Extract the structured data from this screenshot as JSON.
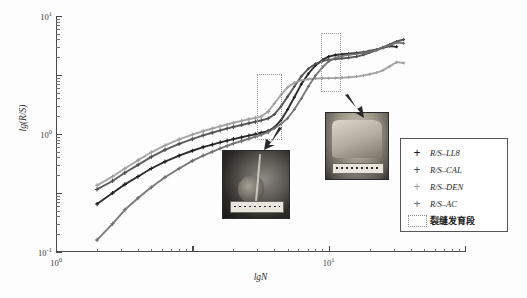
{
  "chart_data": {
    "type": "scatter",
    "title": "",
    "xlabel": "lgN",
    "ylabel": "lg(R/S)",
    "xscale": "log",
    "yscale": "log",
    "xlim": [
      1,
      1000
    ],
    "ylim": [
      0.001,
      10
    ],
    "grid": false,
    "legend_position": "right-bottom",
    "x_ticks": [
      "10⁰",
      "10¹",
      "10²",
      "10³"
    ],
    "x_tick_values": [
      1,
      10,
      100,
      1000
    ],
    "y_ticks": [
      "10¹",
      "10⁰",
      "10⁻¹",
      "10⁻²",
      "10⁻³"
    ],
    "y_tick_values": [
      10,
      1,
      0.1,
      0.01,
      0.001
    ],
    "series": [
      {
        "name": "R/S-LL8",
        "marker": "plus",
        "color": "#1c1c1c",
        "x": [
          2.0,
          2.6,
          3.2,
          4.0,
          5.0,
          6.3,
          8.0,
          10.0,
          12.0,
          14.0,
          16.0,
          18.0,
          20.0,
          23.0,
          26.0,
          29.0,
          32.0,
          36.0,
          40.0,
          45.0,
          50.0,
          56.0,
          63.0,
          71.0,
          80.0,
          90.0,
          100.0,
          112.0,
          125.0,
          140.0,
          160.0,
          180.0,
          200.0,
          225.0,
          250.0,
          280.0,
          315.0
        ],
        "y": [
          0.0065,
          0.01,
          0.014,
          0.019,
          0.026,
          0.034,
          0.043,
          0.052,
          0.06,
          0.066,
          0.072,
          0.077,
          0.082,
          0.088,
          0.094,
          0.099,
          0.105,
          0.112,
          0.13,
          0.175,
          0.26,
          0.42,
          0.7,
          1.05,
          1.45,
          1.8,
          2.05,
          2.18,
          2.25,
          2.3,
          2.36,
          2.44,
          2.55,
          2.7,
          2.9,
          3.1,
          3.0
        ]
      },
      {
        "name": "R/S-CAL",
        "marker": "plus",
        "color": "#4d4d4d",
        "x": [
          2.0,
          2.6,
          3.2,
          4.0,
          5.0,
          6.3,
          8.0,
          10.0,
          12.0,
          14.0,
          16.0,
          18.0,
          20.0,
          23.0,
          26.0,
          29.0,
          32.0,
          36.0,
          40.0,
          45.0,
          50.0,
          56.0,
          63.0,
          71.0,
          80.0,
          90.0,
          100.0,
          112.0,
          125.0,
          140.0,
          160.0,
          180.0,
          200.0,
          225.0,
          250.0,
          280.0,
          315.0,
          355.0
        ],
        "y": [
          0.0115,
          0.016,
          0.022,
          0.03,
          0.041,
          0.054,
          0.068,
          0.082,
          0.095,
          0.105,
          0.115,
          0.124,
          0.132,
          0.142,
          0.152,
          0.161,
          0.17,
          0.183,
          0.215,
          0.3,
          0.43,
          0.64,
          0.95,
          1.28,
          1.55,
          1.72,
          1.82,
          1.86,
          1.9,
          1.96,
          2.05,
          2.2,
          2.4,
          2.65,
          2.95,
          3.3,
          3.7,
          4.0
        ]
      },
      {
        "name": "R/S-DEN",
        "marker": "plus",
        "color": "#9e9e9e",
        "x": [
          2.0,
          2.6,
          3.2,
          4.0,
          5.0,
          6.3,
          8.0,
          10.0,
          12.0,
          14.0,
          16.0,
          18.0,
          20.0,
          23.0,
          26.0,
          29.0,
          32.0,
          36.0,
          40.0,
          45.0,
          50.0,
          56.0,
          63.0,
          71.0,
          80.0,
          90.0,
          100.0,
          112.0,
          125.0,
          140.0,
          160.0,
          180.0,
          200.0,
          225.0,
          250.0,
          280.0,
          315.0,
          355.0
        ],
        "y": [
          0.0135,
          0.019,
          0.026,
          0.036,
          0.049,
          0.064,
          0.081,
          0.098,
          0.112,
          0.124,
          0.135,
          0.145,
          0.155,
          0.167,
          0.178,
          0.188,
          0.198,
          0.24,
          0.33,
          0.47,
          0.62,
          0.74,
          0.81,
          0.85,
          0.87,
          0.88,
          0.885,
          0.89,
          0.9,
          0.915,
          0.94,
          0.98,
          1.03,
          1.1,
          1.2,
          1.4,
          1.65,
          1.6
        ]
      },
      {
        "name": "R/S-AC",
        "marker": "plus",
        "color": "#6f6f6f",
        "x": [
          2.0,
          2.6,
          3.2,
          4.0,
          5.0,
          6.3,
          8.0,
          10.0,
          12.0,
          14.0,
          16.0,
          18.0,
          20.0,
          23.0,
          26.0,
          29.0,
          32.0,
          36.0,
          40.0,
          45.0,
          50.0,
          56.0,
          63.0,
          71.0,
          80.0,
          90.0,
          100.0,
          112.0,
          125.0,
          140.0,
          160.0,
          180.0,
          200.0,
          225.0,
          250.0,
          280.0,
          315.0,
          355.0
        ],
        "y": [
          0.0016,
          0.003,
          0.0052,
          0.0082,
          0.0125,
          0.0185,
          0.026,
          0.035,
          0.043,
          0.05,
          0.057,
          0.063,
          0.069,
          0.076,
          0.083,
          0.09,
          0.097,
          0.108,
          0.125,
          0.15,
          0.185,
          0.26,
          0.4,
          0.64,
          0.98,
          1.35,
          1.7,
          1.95,
          2.1,
          2.2,
          2.28,
          2.38,
          2.5,
          2.68,
          2.9,
          3.18,
          3.55,
          3.45
        ]
      }
    ],
    "annotations": [
      {
        "name": "fracture-zone-box-1",
        "type": "dotted-rect",
        "x_range": [
          30,
          44
        ],
        "y_range": [
          0.085,
          1.05
        ]
      },
      {
        "name": "fracture-zone-box-2",
        "type": "dotted-rect",
        "x_range": [
          88,
          120
        ],
        "y_range": [
          0.55,
          5.2
        ]
      },
      {
        "name": "arrow-to-left-core",
        "type": "arrow",
        "target": "core-photo-left"
      },
      {
        "name": "arrow-to-right-core",
        "type": "arrow",
        "target": "core-photo-right"
      }
    ]
  },
  "axes": {
    "y_title": "lg(R/S)",
    "x_title": "lgN",
    "y_tick_labels": [
      {
        "base": "10",
        "exp": "1",
        "value": 10
      },
      {
        "base": "10",
        "exp": "0",
        "value": 1
      },
      {
        "base": "10",
        "exp": "-1",
        "value": 0.1
      },
      {
        "base": "10",
        "exp": "-2",
        "value": 0.01
      },
      {
        "base": "10",
        "exp": "-3",
        "value": 0.001
      }
    ],
    "x_tick_labels": [
      {
        "base": "10",
        "exp": "0",
        "value": 1
      },
      {
        "base": "10",
        "exp": "1",
        "value": 10
      },
      {
        "base": "10",
        "exp": "2",
        "value": 100
      },
      {
        "base": "10",
        "exp": "3",
        "value": 1000
      }
    ]
  },
  "legend": {
    "entries": [
      {
        "marker": "plus-marker",
        "glyph": "+",
        "label": "R/S–LL8",
        "color": "#1c1c1c"
      },
      {
        "marker": "plus-marker",
        "glyph": "+",
        "label": "R/S–CAL",
        "color": "#4d4d4d"
      },
      {
        "marker": "plus-marker",
        "glyph": "+",
        "label": "R/S–DEN",
        "color": "#9e9e9e"
      },
      {
        "marker": "plus-marker",
        "glyph": "+",
        "label": "R/S–AC",
        "color": "#6f6f6f"
      },
      {
        "marker": "dotted-rect-swatch",
        "glyph": "",
        "label": "裂缝发育段",
        "color": "#8d8d8d"
      }
    ]
  },
  "photos": [
    {
      "name": "core-photo-left",
      "caption": ""
    },
    {
      "name": "core-photo-right",
      "caption": ""
    }
  ]
}
